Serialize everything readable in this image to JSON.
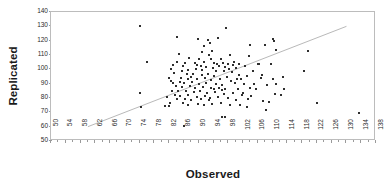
{
  "chart_data": {
    "type": "scatter",
    "title": "",
    "xlabel": "Observed",
    "ylabel": "Replicated",
    "xlim": [
      50,
      138
    ],
    "ylim": [
      50,
      140
    ],
    "xtick_step": 4,
    "ytick_step": 10,
    "grid": false,
    "legend": null,
    "marker": "square",
    "marker_color": "#2e2e2e",
    "xticks": [
      50,
      54,
      58,
      62,
      66,
      70,
      74,
      78,
      82,
      86,
      90,
      94,
      98,
      102,
      106,
      110,
      114,
      118,
      122,
      126,
      130,
      134,
      138
    ],
    "yticks": [
      50,
      60,
      70,
      80,
      90,
      100,
      110,
      120,
      130,
      140
    ],
    "trendline": {
      "present": true,
      "color": "#b9b9b9",
      "x_start": 60,
      "y_start": 60,
      "x_end": 130,
      "y_end": 130
    },
    "points": [
      [
        74.0,
        130.5
      ],
      [
        97.5,
        129.0
      ],
      [
        84.2,
        122.3
      ],
      [
        89.8,
        121.0
      ],
      [
        92.4,
        120.3
      ],
      [
        95.1,
        122.0
      ],
      [
        93.0,
        118.6
      ],
      [
        110.0,
        121.5
      ],
      [
        110.4,
        119.5
      ],
      [
        104.0,
        117.3
      ],
      [
        108.0,
        117.0
      ],
      [
        91.3,
        116.5
      ],
      [
        93.6,
        113.0
      ],
      [
        110.9,
        113.5
      ],
      [
        119.5,
        112.5
      ],
      [
        84.6,
        111.0
      ],
      [
        92.8,
        109.7
      ],
      [
        98.5,
        110.3
      ],
      [
        103.5,
        109.5
      ],
      [
        87.4,
        107.8
      ],
      [
        90.0,
        107.2
      ],
      [
        96.1,
        107.5
      ],
      [
        84.0,
        105.2
      ],
      [
        86.3,
        104.6
      ],
      [
        88.9,
        104.2
      ],
      [
        91.5,
        104.8
      ],
      [
        94.2,
        104.5
      ],
      [
        95.0,
        103.8
      ],
      [
        96.6,
        104.1
      ],
      [
        98.0,
        103.6
      ],
      [
        99.4,
        103.2
      ],
      [
        101.0,
        104.0
      ],
      [
        76.0,
        105.0
      ],
      [
        83.1,
        103.0
      ],
      [
        85.7,
        102.1
      ],
      [
        90.6,
        102.6
      ],
      [
        92.1,
        101.7
      ],
      [
        93.8,
        101.2
      ],
      [
        95.6,
        102.0
      ],
      [
        97.2,
        101.5
      ],
      [
        100.2,
        101.0
      ],
      [
        102.6,
        102.3
      ],
      [
        106.2,
        103.5
      ],
      [
        109.6,
        103.4
      ],
      [
        82.6,
        100.0
      ],
      [
        87.0,
        99.3
      ],
      [
        89.2,
        100.4
      ],
      [
        91.0,
        99.8
      ],
      [
        94.6,
        99.0
      ],
      [
        96.9,
        98.6
      ],
      [
        99.0,
        98.0
      ],
      [
        104.6,
        99.0
      ],
      [
        118.5,
        98.5
      ],
      [
        83.4,
        97.2
      ],
      [
        86.8,
        96.5
      ],
      [
        88.4,
        97.0
      ],
      [
        90.8,
        96.2
      ],
      [
        92.6,
        96.8
      ],
      [
        94.0,
        95.6
      ],
      [
        97.6,
        95.0
      ],
      [
        100.8,
        96.0
      ],
      [
        103.0,
        95.3
      ],
      [
        82.0,
        94.2
      ],
      [
        85.2,
        93.8
      ],
      [
        87.8,
        94.6
      ],
      [
        89.4,
        93.2
      ],
      [
        91.8,
        94.0
      ],
      [
        93.4,
        92.6
      ],
      [
        95.8,
        93.0
      ],
      [
        98.8,
        92.2
      ],
      [
        101.4,
        93.5
      ],
      [
        106.8,
        94.2
      ],
      [
        110.2,
        93.0
      ],
      [
        82.4,
        92.0
      ],
      [
        84.8,
        91.4
      ],
      [
        86.0,
        90.8
      ],
      [
        88.2,
        91.2
      ],
      [
        90.2,
        90.0
      ],
      [
        92.0,
        90.6
      ],
      [
        94.8,
        89.8
      ],
      [
        96.3,
        89.0
      ],
      [
        99.8,
        90.2
      ],
      [
        102.2,
        89.5
      ],
      [
        105.0,
        90.0
      ],
      [
        108.6,
        89.2
      ],
      [
        83.8,
        88.6
      ],
      [
        85.4,
        87.8
      ],
      [
        87.6,
        88.2
      ],
      [
        89.0,
        87.0
      ],
      [
        91.2,
        87.6
      ],
      [
        93.2,
        86.8
      ],
      [
        95.4,
        87.2
      ],
      [
        97.0,
        86.0
      ],
      [
        100.6,
        86.6
      ],
      [
        103.8,
        87.0
      ],
      [
        113.0,
        86.4
      ],
      [
        82.8,
        85.2
      ],
      [
        84.4,
        84.6
      ],
      [
        86.6,
        85.0
      ],
      [
        88.6,
        84.0
      ],
      [
        90.4,
        84.8
      ],
      [
        92.2,
        83.6
      ],
      [
        94.4,
        84.2
      ],
      [
        96.8,
        83.0
      ],
      [
        99.2,
        83.8
      ],
      [
        102.0,
        83.2
      ],
      [
        110.6,
        83.0
      ],
      [
        112.2,
        82.4
      ],
      [
        74.0,
        83.6
      ],
      [
        83.6,
        82.0
      ],
      [
        85.0,
        81.4
      ],
      [
        87.2,
        81.8
      ],
      [
        89.6,
        80.6
      ],
      [
        91.6,
        81.2
      ],
      [
        93.0,
        80.0
      ],
      [
        95.2,
        80.8
      ],
      [
        97.8,
        80.2
      ],
      [
        101.6,
        82.0
      ],
      [
        104.2,
        81.6
      ],
      [
        107.4,
        78.0
      ],
      [
        81.4,
        80.4
      ],
      [
        84.0,
        79.0
      ],
      [
        86.4,
        79.6
      ],
      [
        88.0,
        78.8
      ],
      [
        90.6,
        79.2
      ],
      [
        92.8,
        78.4
      ],
      [
        100.0,
        78.6
      ],
      [
        103.4,
        79.0
      ],
      [
        109.0,
        77.0
      ],
      [
        108.2,
        71.5
      ],
      [
        82.2,
        76.8
      ],
      [
        85.8,
        76.2
      ],
      [
        87.0,
        75.4
      ],
      [
        89.8,
        76.0
      ],
      [
        91.4,
        75.0
      ],
      [
        93.6,
        75.6
      ],
      [
        96.0,
        76.4
      ],
      [
        98.4,
        74.8
      ],
      [
        101.2,
        75.2
      ],
      [
        103.2,
        74.0
      ],
      [
        81.0,
        74.2
      ],
      [
        82.0,
        74.4
      ],
      [
        74.5,
        74.0
      ],
      [
        96.4,
        67.0
      ],
      [
        97.0,
        66.8
      ],
      [
        86.0,
        60.5
      ],
      [
        122.0,
        76.2
      ],
      [
        133.5,
        69.5
      ],
      [
        94.0,
        86.0
      ],
      [
        96.2,
        85.4
      ],
      [
        98.2,
        100.5
      ],
      [
        99.6,
        105.0
      ],
      [
        91.0,
        112.0
      ],
      [
        93.3,
        107.0
      ],
      [
        89.4,
        103.0
      ],
      [
        87.2,
        93.4
      ],
      [
        85.6,
        98.5
      ],
      [
        83.0,
        90.5
      ],
      [
        100.4,
        93.0
      ],
      [
        105.4,
        86.0
      ],
      [
        106.0,
        103.5
      ],
      [
        107.0,
        96.0
      ],
      [
        111.0,
        90.0
      ],
      [
        112.8,
        94.5
      ]
    ]
  }
}
